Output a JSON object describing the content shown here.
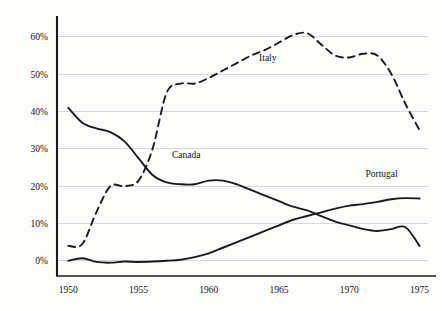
{
  "chart_data": {
    "type": "line",
    "title": "",
    "subtitle": "",
    "xlabel": "",
    "ylabel": "",
    "xlim": [
      1949.2,
      1975.6
    ],
    "ylim": [
      -3,
      64
    ],
    "grid": true,
    "legend_position": "inline-annotations",
    "x_ticks": [
      "1950",
      "1955",
      "1960",
      "1965",
      "1970",
      "1975"
    ],
    "x_tick_values": [
      1950,
      1955,
      1960,
      1965,
      1970,
      1975
    ],
    "y_ticks": [
      "0%",
      "10%",
      "20%",
      "30%",
      "40%",
      "50%",
      "60%"
    ],
    "y_tick_values": [
      0,
      10,
      20,
      30,
      40,
      50,
      60
    ],
    "x": [
      1950,
      1951,
      1952,
      1953,
      1954,
      1955,
      1956,
      1957,
      1958,
      1959,
      1960,
      1961,
      1962,
      1963,
      1964,
      1965,
      1966,
      1967,
      1968,
      1969,
      1970,
      1971,
      1972,
      1973,
      1974,
      1975
    ],
    "series": [
      {
        "name": "Canada",
        "style": "solid",
        "color": "#1a1a1a",
        "values": [
          41,
          37,
          35.5,
          34.5,
          32,
          27.5,
          23,
          21,
          20.5,
          20.5,
          21.5,
          21.5,
          20.5,
          19,
          17.5,
          16,
          14.5,
          13.5,
          12,
          10.5,
          9.5,
          8.5,
          8,
          8.5,
          9,
          4
        ]
      },
      {
        "name": "Italy",
        "style": "dashed",
        "color": "#1a1a1a",
        "values": [
          4,
          4.5,
          13,
          20,
          20,
          21.5,
          30,
          45,
          47.5,
          47.5,
          49,
          51,
          53,
          55,
          56.5,
          58.5,
          60.5,
          61,
          58,
          55,
          54.5,
          55.5,
          55,
          50,
          42,
          35
        ]
      },
      {
        "name": "Portugal",
        "style": "solid",
        "color": "#1a1a1a",
        "values": [
          0,
          0.7,
          -0.3,
          -0.5,
          -0.2,
          -0.3,
          -0.2,
          0,
          0.3,
          1,
          2,
          3.5,
          5,
          6.5,
          8,
          9.5,
          11,
          12,
          13,
          14,
          14.8,
          15.2,
          15.8,
          16.5,
          16.8,
          16.7
        ]
      }
    ],
    "annotations": [
      {
        "text": "Italy",
        "x": 1964.2,
        "y": 53.5
      },
      {
        "text": "Canada",
        "x": 1958.4,
        "y": 27.5
      },
      {
        "text": "Portugal",
        "x": 1972.3,
        "y": 22.5
      }
    ]
  }
}
